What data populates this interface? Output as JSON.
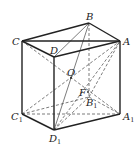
{
  "figure": {
    "background": "#ffffff",
    "line_color": "#222222"
  },
  "vertices": {
    "A": {
      "label": "A",
      "sub": "",
      "x": 120,
      "y": 41
    },
    "B": {
      "label": "B",
      "sub": "",
      "x": 89,
      "y": 23
    },
    "C": {
      "label": "C",
      "sub": "",
      "x": 22,
      "y": 41
    },
    "D": {
      "label": "D",
      "sub": "",
      "x": 54,
      "y": 57
    },
    "A1": {
      "label": "A",
      "sub": "1",
      "x": 120,
      "y": 114
    },
    "B1": {
      "label": "B",
      "sub": "1",
      "x": 89,
      "y": 97
    },
    "C1": {
      "label": "C",
      "sub": "1",
      "x": 22,
      "y": 114
    },
    "D1": {
      "label": "D",
      "sub": "1",
      "x": 54,
      "y": 130
    },
    "O": {
      "label": "O",
      "sub": "",
      "x": 71,
      "y": 78
    },
    "F": {
      "label": "F",
      "sub": "",
      "x": 88,
      "y": 92
    }
  },
  "labels": {
    "A": {
      "text": "A",
      "sub": "",
      "x": 123,
      "y": 45
    },
    "B": {
      "text": "B",
      "sub": "",
      "x": 86,
      "y": 20
    },
    "C": {
      "text": "C",
      "sub": "",
      "x": 12,
      "y": 45
    },
    "D": {
      "text": "D",
      "sub": "",
      "x": 50,
      "y": 54
    },
    "O": {
      "text": "O",
      "sub": "",
      "x": 67,
      "y": 76
    },
    "F": {
      "text": "F",
      "sub": "",
      "x": 79,
      "y": 96
    },
    "A1": {
      "text": "A",
      "sub": "1",
      "x": 123,
      "y": 120
    },
    "B1": {
      "text": "B",
      "sub": "1",
      "x": 86,
      "y": 106
    },
    "C1": {
      "text": "C",
      "sub": "1",
      "x": 11,
      "y": 120
    },
    "D1": {
      "text": "D",
      "sub": "1",
      "x": 49,
      "y": 142
    }
  },
  "edges": {
    "solid": [
      [
        "C",
        "B"
      ],
      [
        "B",
        "A"
      ],
      [
        "A",
        "D"
      ],
      [
        "D",
        "C"
      ],
      [
        "C",
        "A"
      ],
      [
        "C",
        "C1"
      ],
      [
        "D",
        "D1"
      ],
      [
        "A",
        "A1"
      ],
      [
        "C1",
        "D1"
      ],
      [
        "D1",
        "A1"
      ]
    ],
    "thin": [
      [
        "D",
        "B"
      ],
      [
        "D1",
        "B"
      ]
    ],
    "dashed": [
      [
        "B",
        "B1"
      ],
      [
        "C1",
        "B1"
      ],
      [
        "B1",
        "A1"
      ],
      [
        "C1",
        "A1"
      ],
      [
        "C",
        "A1"
      ],
      [
        "C1",
        "A"
      ],
      [
        "D1",
        "A"
      ],
      [
        "D1",
        "B1"
      ],
      [
        "B1",
        "A"
      ]
    ]
  }
}
